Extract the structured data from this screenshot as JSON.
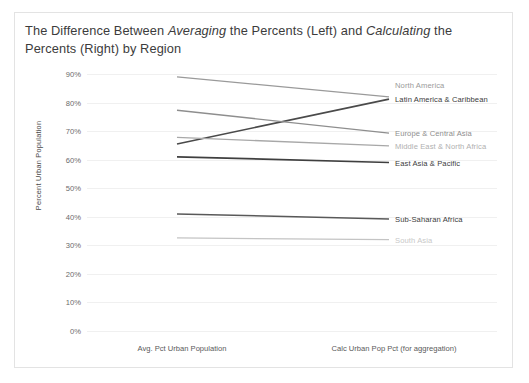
{
  "chart": {
    "title_part1": "The Difference Between ",
    "title_em1": "Averaging",
    "title_part2": " the Percents (Left) and ",
    "title_em2": "Calculating",
    "title_part3": " the Percents (Right) by Region",
    "y_axis_title": "Percent Urban Population",
    "frame_border_color": "#e3e3e3",
    "gridline_color": "#f0f0f0"
  },
  "chart_data": {
    "type": "line",
    "title": "The Difference Between Averaging the Percents (Left) and Calculating the Percents (Right) by Region",
    "subtitle": "",
    "xlabel": "",
    "ylabel": "Percent Urban Population",
    "categories": [
      "Avg. Pct Urban Population",
      "Calc Urban Pop Pct (for aggregation)"
    ],
    "x_tick_labels": [
      "Avg. Pct Urban Population",
      "Calc Urban Pop Pct (for aggregation)"
    ],
    "y_tick_labels": [
      "90%",
      "80%",
      "70%",
      "60%",
      "50%",
      "40%",
      "30%",
      "20%",
      "10%",
      "0%"
    ],
    "y_tick_values": [
      90,
      80,
      70,
      60,
      50,
      40,
      30,
      20,
      10,
      0
    ],
    "ylim": [
      0,
      90
    ],
    "grid": true,
    "legend_position": "right-inline-labels",
    "series": [
      {
        "name": "North America",
        "values": [
          89.0,
          82.0
        ],
        "color": "#9a9a9a",
        "label_color": "#9a9a9a",
        "width": 1.3
      },
      {
        "name": "Latin America & Caribbean",
        "values": [
          65.5,
          81.2
        ],
        "color": "#4a4a4a",
        "label_color": "#3c3c3c",
        "width": 1.7
      },
      {
        "name": "Europe & Central Asia",
        "values": [
          77.3,
          69.3
        ],
        "color": "#8e8e8e",
        "label_color": "#8e8e8e",
        "width": 1.3
      },
      {
        "name": "Middle East & North Africa",
        "values": [
          67.8,
          64.8
        ],
        "color": "#a8a8a8",
        "label_color": "#b0b0b0",
        "width": 1.3
      },
      {
        "name": "East Asia & Pacific",
        "values": [
          61.0,
          59.0
        ],
        "color": "#3f3f3f",
        "label_color": "#3c3c3c",
        "width": 1.7
      },
      {
        "name": "Sub-Saharan Africa",
        "values": [
          41.0,
          39.2
        ],
        "color": "#595959",
        "label_color": "#3c3c3c",
        "width": 1.5
      },
      {
        "name": "South Asia",
        "values": [
          32.6,
          32.0
        ],
        "color": "#c4c4c4",
        "label_color": "#c8c8c8",
        "width": 1.3
      }
    ]
  }
}
